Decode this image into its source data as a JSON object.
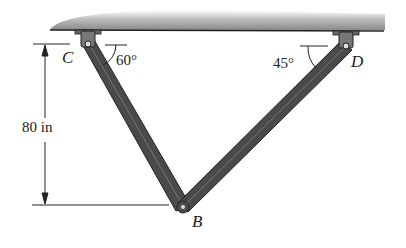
{
  "labels": {
    "point_c": "C",
    "point_d": "D",
    "point_b": "B",
    "angle_c": "60°",
    "angle_d": "45°",
    "height": "80 in"
  },
  "colors": {
    "member_fill": "#4a4a4a",
    "member_edge": "#222222",
    "ceiling": "#8a8a8a",
    "line": "#222222"
  }
}
